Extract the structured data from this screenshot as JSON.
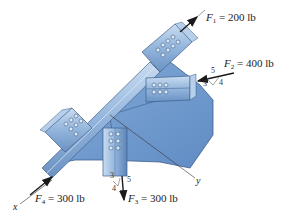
{
  "diagram": {
    "forces": [
      {
        "id": "F1",
        "symbol": "F",
        "subscript": "1",
        "value": "= 200 lb",
        "direction": "along member, up-right (away from plate)"
      },
      {
        "id": "F2",
        "symbol": "F",
        "subscript": "2",
        "value": "= 400 lb",
        "direction": "toward plate, slope 3-4-5",
        "slope": {
          "hyp": "5",
          "a": "3",
          "b": "4"
        }
      },
      {
        "id": "F3",
        "symbol": "F",
        "subscript": "3",
        "value": "= 300 lb",
        "direction": "downward, slope 3-4-5",
        "slope": {
          "hyp": "5",
          "a": "3",
          "b": "4"
        }
      },
      {
        "id": "F4",
        "symbol": "F",
        "subscript": "4",
        "value": "= 300 lb",
        "direction": "along x axis toward plate"
      }
    ],
    "axes": {
      "x": "x",
      "y": "y"
    },
    "colors": {
      "plate": "#6f9bd1",
      "plate_edge": "#3d5f8a",
      "member": "#8fb3dd",
      "member_dark": "#5a7fae",
      "arrow": "#1a1a1a"
    }
  }
}
